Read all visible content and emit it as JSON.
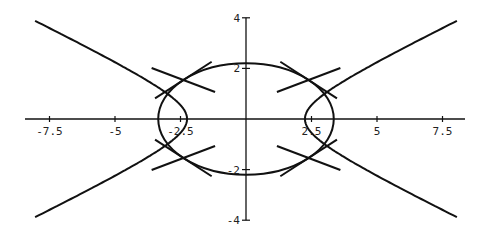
{
  "chart_data": {
    "type": "line",
    "title": "",
    "xlabel": "",
    "ylabel": "",
    "xlim": [
      -8.5,
      8.5
    ],
    "ylim": [
      -4,
      4
    ],
    "grid": false,
    "x_ticks": [
      -7.5,
      -5,
      -2.5,
      2.5,
      5,
      7.5
    ],
    "x_tick_labels": [
      "-7.5",
      "-5",
      "-2.5",
      "2.5",
      "5",
      "7.5"
    ],
    "y_ticks": [
      -4,
      -2,
      2,
      4
    ],
    "y_tick_labels": [
      "-4",
      "-2",
      "2",
      "4"
    ],
    "curves": [
      {
        "name": "ellipse",
        "equation": "x^2/3.35^2 + y^2/2.2^2 = 1",
        "a": 3.35,
        "b": 2.2
      },
      {
        "name": "hyperbola",
        "equation": "x^2/2.25^2 - y^2/1.13^2 = 1",
        "a": 2.25,
        "b": 1.13,
        "x_range": [
          -8.05,
          8.05
        ]
      },
      {
        "name": "tangent-lines",
        "description": "tangent lines to both curves at their four intersection points (~(±2.85, ±1.15)), crossing the x-axis near x = ±3.9"
      }
    ]
  },
  "axes": {
    "color": "#111111",
    "curve_color": "#111111"
  }
}
